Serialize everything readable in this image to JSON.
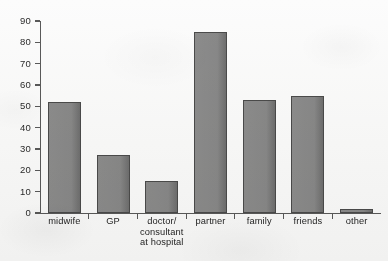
{
  "chart_data": {
    "type": "bar",
    "title": "",
    "subtitle": "",
    "xlabel": "",
    "ylabel": "",
    "ylim": [
      0,
      90
    ],
    "ytick_step": 10,
    "yticks": [
      0,
      10,
      20,
      30,
      40,
      50,
      60,
      70,
      80,
      90
    ],
    "grid": false,
    "legend": false,
    "legend_position": "none",
    "categories": [
      "midwife",
      "doctor/\nconsultant\nat hospital",
      "GP",
      "partner",
      "family",
      "friends",
      "other"
    ],
    "category_labels": [
      {
        "lines": [
          "midwife"
        ]
      },
      {
        "lines": [
          "GP"
        ]
      },
      {
        "lines": [
          "doctor/",
          "consultant",
          "at hospital"
        ]
      },
      {
        "lines": [
          "partner"
        ]
      },
      {
        "lines": [
          "family"
        ]
      },
      {
        "lines": [
          "friends"
        ]
      },
      {
        "lines": [
          "other"
        ]
      }
    ],
    "values": [
      52,
      27,
      15,
      85,
      53,
      55,
      2
    ],
    "bars": [
      {
        "label": "midwife",
        "value": 52
      },
      {
        "label": "GP",
        "value": 27
      },
      {
        "label": "doctor/consultant at hospital",
        "value": 15
      },
      {
        "label": "partner",
        "value": 85
      },
      {
        "label": "family",
        "value": 53
      },
      {
        "label": "friends",
        "value": 55
      },
      {
        "label": "other",
        "value": 2
      }
    ],
    "colors": {
      "bar_fill": "#8a8a8a",
      "bar_edge": "#4b4b4b",
      "axis": "#5a5a5a",
      "text": "#1f1f1f",
      "background": "#fdfdfd"
    }
  },
  "y_axis": {
    "labels": [
      "90",
      "80",
      "70",
      "60",
      "50",
      "40",
      "30",
      "20",
      "10",
      "0"
    ]
  }
}
